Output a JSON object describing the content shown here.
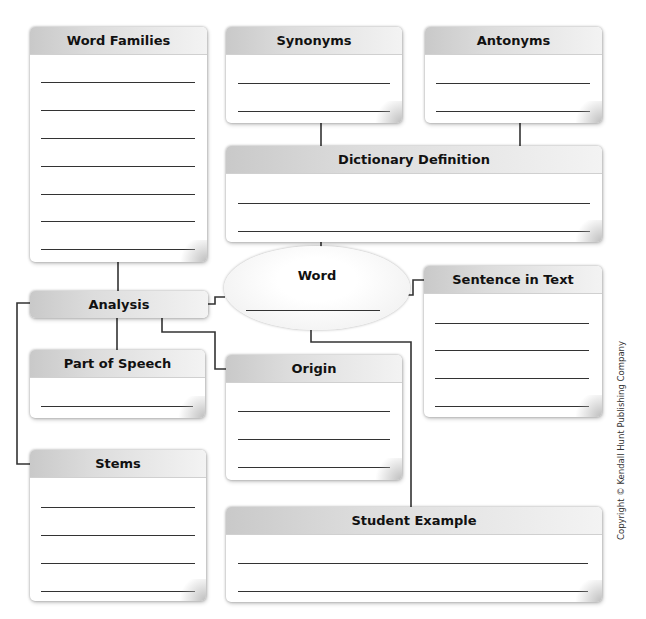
{
  "diagram": {
    "center": {
      "label": "Word",
      "blank_lines": 1
    },
    "boxes": {
      "word_families": {
        "label": "Word Families",
        "blank_lines": 7
      },
      "synonyms": {
        "label": "Synonyms",
        "blank_lines": 2
      },
      "antonyms": {
        "label": "Antonyms",
        "blank_lines": 2
      },
      "dictionary_definition": {
        "label": "Dictionary Definition",
        "blank_lines": 2
      },
      "analysis": {
        "label": "Analysis",
        "blank_lines": 0
      },
      "sentence_in_text": {
        "label": "Sentence in Text",
        "blank_lines": 4
      },
      "part_of_speech": {
        "label": "Part of Speech",
        "blank_lines": 1
      },
      "origin": {
        "label": "Origin",
        "blank_lines": 3
      },
      "stems": {
        "label": "Stems",
        "blank_lines": 4
      },
      "student_example": {
        "label": "Student Example",
        "blank_lines": 2
      }
    },
    "connections": [
      [
        "word_families",
        "analysis"
      ],
      [
        "synonyms",
        "dictionary_definition"
      ],
      [
        "antonyms",
        "dictionary_definition"
      ],
      [
        "dictionary_definition",
        "word"
      ],
      [
        "analysis",
        "word"
      ],
      [
        "word",
        "sentence_in_text"
      ],
      [
        "word",
        "student_example"
      ],
      [
        "analysis",
        "part_of_speech"
      ],
      [
        "analysis",
        "origin"
      ],
      [
        "analysis",
        "stems"
      ]
    ],
    "copyright": "Copyright © Kendall Hunt Publishing Company"
  },
  "colors": {
    "line": "#333333",
    "header_dark": "#c9c9c9",
    "header_light": "#f3f3f3"
  }
}
